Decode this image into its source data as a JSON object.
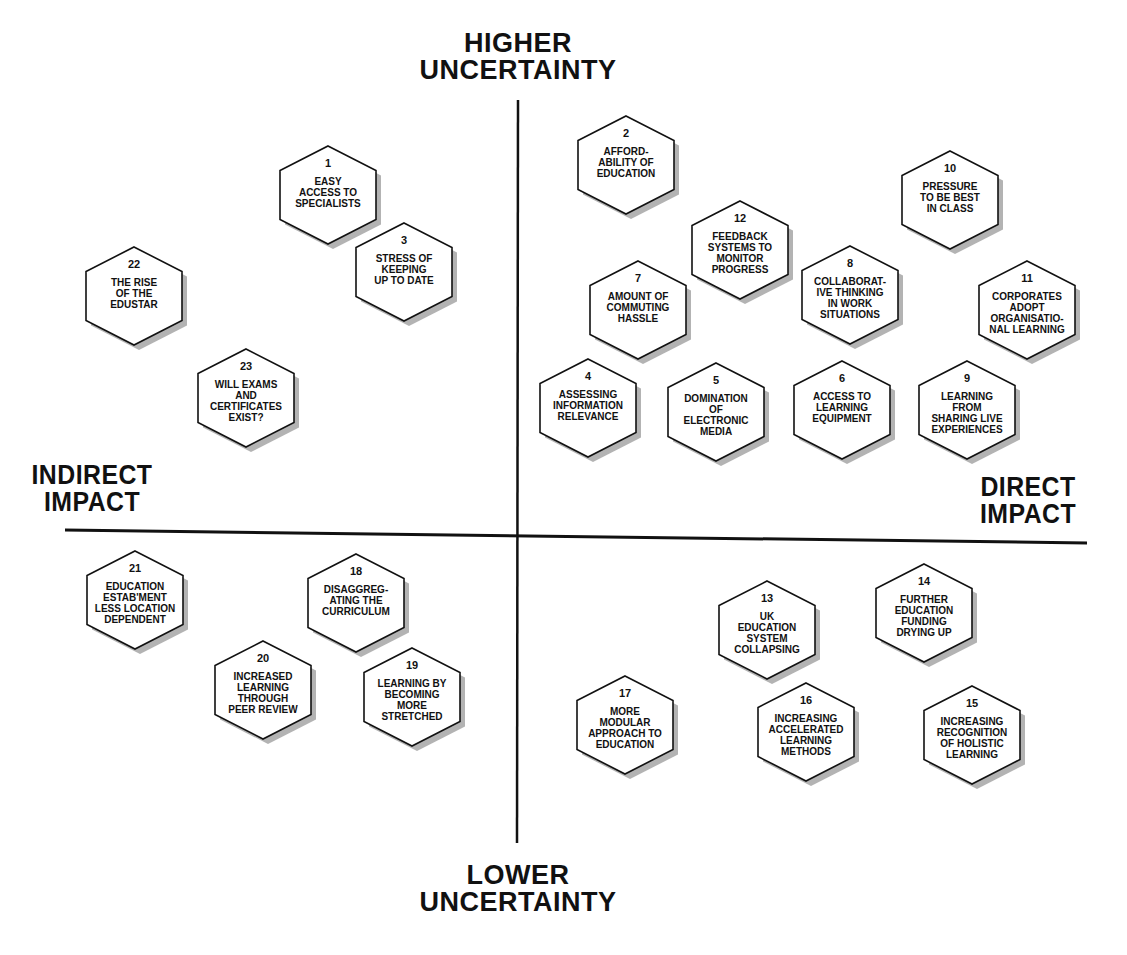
{
  "axes": {
    "top": "HIGHER\nUNCERTAINTY",
    "bottom": "LOWER\nUNCERTAINTY",
    "left": "INDIRECT\nIMPACT",
    "right": "DIRECT\nIMPACT"
  },
  "factors": [
    {
      "num": "1",
      "text": "EASY\nACCESS TO\nSPECIALISTS",
      "cx": 328,
      "cy": 195
    },
    {
      "num": "2",
      "text": "AFFORD-\nABILITY OF\nEDUCATION",
      "cx": 626,
      "cy": 165
    },
    {
      "num": "3",
      "text": "STRESS OF\nKEEPING\nUP TO DATE",
      "cx": 404,
      "cy": 272
    },
    {
      "num": "4",
      "text": "ASSESSING\nINFORMATION\nRELEVANCE",
      "cx": 588,
      "cy": 408
    },
    {
      "num": "5",
      "text": "DOMINATION\nOF\nELECTRONIC\nMEDIA",
      "cx": 716,
      "cy": 412
    },
    {
      "num": "6",
      "text": "ACCESS TO\nLEARNING\nEQUIPMENT",
      "cx": 842,
      "cy": 410
    },
    {
      "num": "7",
      "text": "AMOUNT OF\nCOMMUTING\nHASSLE",
      "cx": 638,
      "cy": 310
    },
    {
      "num": "8",
      "text": "COLLABORAT-\nIVE THINKING\nIN WORK\nSITUATIONS",
      "cx": 850,
      "cy": 295
    },
    {
      "num": "9",
      "text": "LEARNING\nFROM\nSHARING LIVE\nEXPERIENCES",
      "cx": 967,
      "cy": 410
    },
    {
      "num": "10",
      "text": "PRESSURE\nTO BE BEST\nIN CLASS",
      "cx": 950,
      "cy": 200
    },
    {
      "num": "11",
      "text": "CORPORATES\nADOPT\nORGANISATIO-\nNAL LEARNING",
      "cx": 1027,
      "cy": 310
    },
    {
      "num": "12",
      "text": "FEEDBACK\nSYSTEMS TO\nMONITOR\nPROGRESS",
      "cx": 740,
      "cy": 250
    },
    {
      "num": "13",
      "text": "UK\nEDUCATION\nSYSTEM\nCOLLAPSING",
      "cx": 767,
      "cy": 630
    },
    {
      "num": "14",
      "text": "FURTHER\nEDUCATION\nFUNDING\nDRYING UP",
      "cx": 924,
      "cy": 613
    },
    {
      "num": "15",
      "text": "INCREASING\nRECOGNITION\nOF HOLISTIC\nLEARNING",
      "cx": 972,
      "cy": 735
    },
    {
      "num": "16",
      "text": "INCREASING\nACCELERATED\nLEARNING\nMETHODS",
      "cx": 806,
      "cy": 732
    },
    {
      "num": "17",
      "text": "MORE\nMODULAR\nAPPROACH TO\nEDUCATION",
      "cx": 625,
      "cy": 725
    },
    {
      "num": "18",
      "text": "DISAGGREG-\nATING THE\nCURRICULUM",
      "cx": 356,
      "cy": 603
    },
    {
      "num": "19",
      "text": "LEARNING BY\nBECOMING\nMORE\nSTRETCHED",
      "cx": 412,
      "cy": 697
    },
    {
      "num": "20",
      "text": "INCREASED\nLEARNING\nTHROUGH\nPEER REVIEW",
      "cx": 263,
      "cy": 690
    },
    {
      "num": "21",
      "text": "EDUCATION\nESTAB'MENT\nLESS LOCATION\nDEPENDENT",
      "cx": 135,
      "cy": 600
    },
    {
      "num": "22",
      "text": "THE RISE\nOF THE\nEDUSTAR",
      "cx": 134,
      "cy": 296
    },
    {
      "num": "23",
      "text": "WILL EXAMS\nAND\nCERTIFICATES\nEXIST?",
      "cx": 246,
      "cy": 398
    }
  ]
}
